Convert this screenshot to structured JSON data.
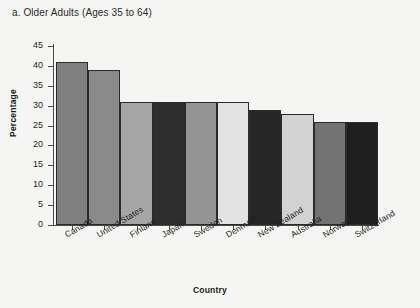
{
  "panel": {
    "title": "a. Older Adults (Ages 35 to 64)"
  },
  "colors": {
    "background": "#f5f5f3",
    "axis": "#4a4a4a",
    "bar_outline": "#2b2b2b",
    "text": "#1a1a1a"
  },
  "chart_data": {
    "type": "bar",
    "title": "a. Older Adults (Ages 35 to 64)",
    "xlabel": "Country",
    "ylabel": "Percentage",
    "categories": [
      "Canada",
      "United States",
      "Finland",
      "Japan",
      "Sweden",
      "Denmark",
      "New Zealand",
      "Australia",
      "Norway",
      "Switzerland"
    ],
    "values": [
      41,
      39,
      31,
      31,
      31,
      31,
      29,
      28,
      26,
      26
    ],
    "bar_colors": [
      "#808080",
      "#8a8a8a",
      "#a6a6a6",
      "#2e2e2e",
      "#949494",
      "#e3e3e3",
      "#262626",
      "#d2d2d2",
      "#737373",
      "#1f1f1f"
    ],
    "ylim": [
      0,
      45
    ],
    "yticks": [
      0,
      5,
      10,
      15,
      20,
      25,
      30,
      35,
      40,
      45
    ],
    "ytick_labels": [
      "0",
      "5",
      "10",
      "15",
      "20",
      "25",
      "30",
      "35",
      "40",
      "45"
    ],
    "grid": false,
    "legend": null,
    "tick_label_rotation": -31
  }
}
